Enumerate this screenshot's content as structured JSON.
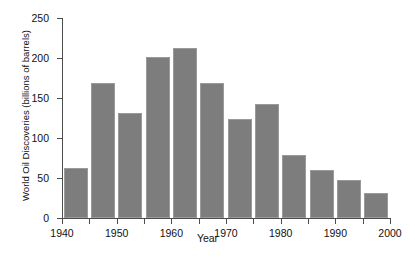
{
  "chart_data": {
    "type": "bar",
    "title": "",
    "xlabel": "Year",
    "ylabel": "World Oil Discoveries (billions of barrels)",
    "categories": [
      "1940",
      "1945",
      "1950",
      "1955",
      "1960",
      "1965",
      "1970",
      "1975",
      "1980",
      "1985",
      "1990",
      "1995"
    ],
    "bin_starts": [
      1940,
      1945,
      1950,
      1955,
      1960,
      1965,
      1970,
      1975,
      1980,
      1985,
      1990,
      1995
    ],
    "bin_width_years": 5,
    "values": [
      62,
      169,
      131,
      201,
      212,
      169,
      124,
      142,
      79,
      60,
      47,
      31
    ],
    "xlim": [
      1940,
      2000
    ],
    "ylim": [
      0,
      250
    ],
    "ytick_values": [
      0,
      50,
      100,
      150,
      200,
      250
    ],
    "ytick_labels": [
      "0",
      "50",
      "100",
      "150",
      "200",
      "250"
    ],
    "xtick_values": [
      1940,
      1945,
      1950,
      1955,
      1960,
      1965,
      1970,
      1975,
      1980,
      1985,
      1990,
      1995,
      2000
    ],
    "xtick_labels_shown": [
      "1940",
      "1950",
      "1960",
      "1970",
      "1980",
      "1990",
      "2000"
    ],
    "grid": false,
    "legend": "none",
    "bar_color": "#7d7d7d",
    "bar_edge_color": "#9a9a9a",
    "axis_color": "#4d4d4d",
    "background_color": "#ffffff"
  }
}
